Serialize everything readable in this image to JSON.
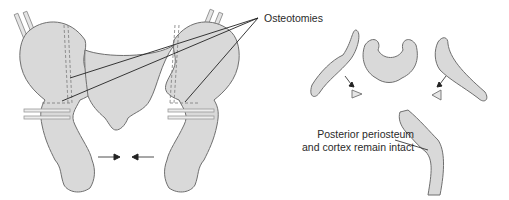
{
  "figure": {
    "colors": {
      "bone_fill": "#d9d9d9",
      "bone_stroke": "#6f6f6f",
      "leader_line": "#222222",
      "pin": "#c8c8c8",
      "background": "#ffffff"
    },
    "labels": {
      "osteotomies": "Osteotomies",
      "posterior_line1": "Posterior periosteum",
      "posterior_line2": "and cortex remain intact"
    },
    "panels": [
      {
        "id": "anterior-view",
        "description": "Pelvis, anterior view with pins and osteotomy lines"
      },
      {
        "id": "axial-section",
        "description": "Axial section of pelvis with wedge-shaped osteotomy gaps"
      },
      {
        "id": "detail-hinge",
        "description": "Close-up of greenstick hinge at posterior cortex"
      }
    ]
  }
}
